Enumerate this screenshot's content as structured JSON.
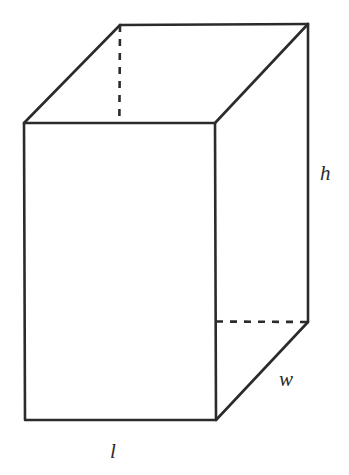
{
  "figure": {
    "shape_name": "rectangular-prism",
    "background_color": "#ffffff",
    "line_color": "#2b2b2b",
    "line_width": 2.6,
    "hidden_dash_pattern": "7 7",
    "labels": {
      "height": "h",
      "width": "w",
      "length": "l"
    },
    "label_positions": {
      "height": {
        "x": 320,
        "y": 180
      },
      "width": {
        "x": 279,
        "y": 386
      },
      "length": {
        "x": 110,
        "y": 458
      }
    },
    "vertices": {
      "front_top_left": {
        "x": 24,
        "y": 123
      },
      "front_top_right": {
        "x": 215,
        "y": 123
      },
      "front_bottom_left": {
        "x": 25,
        "y": 420
      },
      "front_bottom_right": {
        "x": 216,
        "y": 420
      },
      "back_top_left": {
        "x": 120,
        "y": 25
      },
      "back_top_right": {
        "x": 308,
        "y": 24
      },
      "back_bottom_left": {
        "x": 118,
        "y": 321
      },
      "back_bottom_right": {
        "x": 308,
        "y": 322
      }
    },
    "paths": {
      "top_face": "M 24 123 L 120 25 L 308 24 L 215 123 Z",
      "front_face": "M 24 123 L 215 123 L 216 420 L 25 420 Z",
      "right_face": "M 215 123 L 308 24 L 308 322 L 216 420 Z",
      "front_face_outline": "M 24 123 L 215 123 L 216 420 L 25 420 Z",
      "top_left_edge": "M 24 123 L 120 25",
      "top_back_edge": "M 120 25 L 308 24",
      "top_right_edge": "M 308 24 L 215 123",
      "right_vertical_edge": "M 308 24 L 308 322",
      "bottom_right_diagonal": "M 308 322 L 216 420",
      "hidden_vertical_edge": "M 120 25 L 118 321",
      "hidden_bottom_horizontal": "M 118 321 L 308 322",
      "hidden_bottom_diagonal": "M 118 321 L 25 420"
    }
  }
}
